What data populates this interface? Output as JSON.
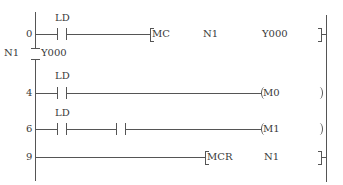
{
  "diagram": {
    "type": "ladder",
    "mc_block": {
      "nest_label": "N1",
      "device": "Y000"
    },
    "rungs": [
      {
        "step": "0",
        "contacts": [
          {
            "label": "LD"
          }
        ],
        "instruction": {
          "mnemonic": "MC",
          "operand1": "N1",
          "operand2": "Y000",
          "style": "bracket"
        }
      },
      {
        "step": "4",
        "contacts": [
          {
            "label": "LD"
          }
        ],
        "instruction": {
          "mnemonic": "M0",
          "style": "coil"
        }
      },
      {
        "step": "6",
        "contacts": [
          {
            "label": "LD"
          },
          {
            "label": ""
          }
        ],
        "instruction": {
          "mnemonic": "M1",
          "style": "coil"
        }
      },
      {
        "step": "9",
        "contacts": [],
        "instruction": {
          "mnemonic": "MCR",
          "operand1": "N1",
          "style": "bracket"
        }
      }
    ],
    "colors": {
      "line": "#555555",
      "text": "#3a3a3a",
      "background": "#ffffff"
    }
  }
}
